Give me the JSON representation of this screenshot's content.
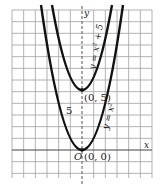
{
  "diagram": {
    "grid": {
      "x0": 12,
      "y0": 10,
      "x1": 152,
      "y1": 178,
      "cell": 11.67
    },
    "axes": {
      "x_label": "x",
      "y_label": "y",
      "origin_label": "O"
    },
    "curves": [
      {
        "name": "y = x^2 + 5",
        "label": "y = x² + 5",
        "vertex": "(0, 5)"
      },
      {
        "name": "y = x^2",
        "label": "y = x²",
        "vertex": "(0, 0)"
      }
    ],
    "annotations": {
      "shift": "5",
      "vertex_top": "(0, 5)",
      "vertex_bottom": "(0, 0)"
    },
    "colors": {
      "grid": "#9a9a9a",
      "curve": "#111111",
      "axis": "#555555"
    }
  }
}
